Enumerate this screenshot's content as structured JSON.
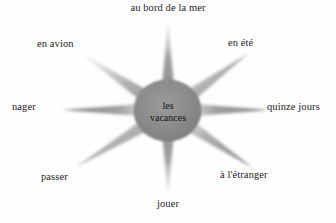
{
  "diagram": {
    "type": "word-web",
    "background_color": "#fefefe",
    "star_color": "#8a8a8a",
    "text_color": "#1c1c1c",
    "center": {
      "line1": "les",
      "line2": "vacances"
    },
    "nodes": [
      {
        "id": "north",
        "label": "au bord de la mer",
        "direction": "N"
      },
      {
        "id": "northeast",
        "label": "en été",
        "direction": "NE"
      },
      {
        "id": "east",
        "label": "quinze jours",
        "direction": "E"
      },
      {
        "id": "southeast",
        "label": "à l'étranger",
        "direction": "SE"
      },
      {
        "id": "south",
        "label": "jouer",
        "direction": "S"
      },
      {
        "id": "southwest",
        "label": "passer",
        "direction": "SW"
      },
      {
        "id": "west",
        "label": "nager",
        "direction": "W"
      },
      {
        "id": "northwest",
        "label": "en avion",
        "direction": "NW"
      }
    ]
  }
}
